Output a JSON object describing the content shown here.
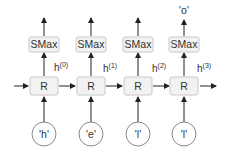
{
  "diagram": {
    "type": "unrolled-rnn",
    "columns": [
      {
        "input": "'h'",
        "cell": "R",
        "hidden": "h",
        "hidden_sup": "(0)",
        "softmax": "SMax",
        "output": ""
      },
      {
        "input": "'e'",
        "cell": "R",
        "hidden": "h",
        "hidden_sup": "(1)",
        "softmax": "SMax",
        "output": ""
      },
      {
        "input": "'l'",
        "cell": "R",
        "hidden": "h",
        "hidden_sup": "(2)",
        "softmax": "SMax",
        "output": ""
      },
      {
        "input": "'l'",
        "cell": "R",
        "hidden": "h",
        "hidden_sup": "(3)",
        "softmax": "SMax",
        "output": "'o'"
      }
    ]
  }
}
